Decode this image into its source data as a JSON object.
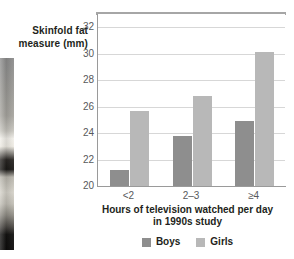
{
  "chart_data": {
    "type": "bar",
    "title": "",
    "categories": [
      "<2",
      "2–3",
      "≥4"
    ],
    "series": [
      {
        "name": "Boys",
        "values": [
          21.2,
          23.8,
          24.9
        ],
        "color": "#8e8e8e"
      },
      {
        "name": "Girls",
        "values": [
          25.7,
          26.8,
          30.1
        ],
        "color": "#b8b8b8"
      }
    ],
    "ylabel": "Skinfold fat measure (mm)",
    "ylabel_lines": [
      "Skinfold fat",
      "measure (mm)"
    ],
    "xlabel": "Hours of television watched per day in 1990s study",
    "xlabel_lines": [
      "Hours of television watched per day",
      "in 1990s study"
    ],
    "ylim": [
      20,
      33
    ],
    "yticks": [
      20,
      22,
      24,
      26,
      28,
      30,
      32
    ],
    "ytick_labels": [
      "20",
      "22",
      "24",
      "26",
      "28",
      "30",
      "32"
    ],
    "grid": "horizontal",
    "legend_position": "bottom-center",
    "legend": [
      "Boys",
      "Girls"
    ]
  },
  "axis": {
    "y_title_line1": "Skinfold fat",
    "y_title_line2": "measure (mm)",
    "x_title_line1": "Hours of television watched per day",
    "x_title_line2": "in 1990s study"
  },
  "colors": {
    "boys": "#8e8e8e",
    "girls": "#b8b8b8",
    "gridline": "#d7d7d7",
    "axis": "#9a9a9a",
    "tick_text": "#58595b",
    "title_text": "#231f20",
    "background": "#ffffff"
  },
  "decoration": {
    "photo_strip": "photo-strip-fragment"
  }
}
